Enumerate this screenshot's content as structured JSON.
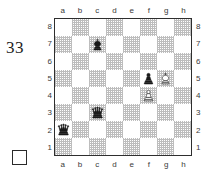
{
  "diagram": {
    "number": "33",
    "side_to_move": "white",
    "side_to_move_icon": "empty-square-icon",
    "files": [
      "a",
      "b",
      "c",
      "d",
      "e",
      "f",
      "g",
      "h"
    ],
    "ranks": [
      "8",
      "7",
      "6",
      "5",
      "4",
      "3",
      "2",
      "1"
    ],
    "board_colors": {
      "light_square": "#ffffff",
      "dark_square": "#bdbdbd",
      "border": "#2e2e2e",
      "text": "#1d1d1d"
    },
    "pieces": [
      {
        "square": "c7",
        "file": "c",
        "rank": "7",
        "color": "black",
        "type": "king",
        "icon": "black-king-icon",
        "symbol": "♚"
      },
      {
        "square": "f5",
        "file": "f",
        "rank": "5",
        "color": "black",
        "type": "pawn",
        "icon": "black-pawn-icon",
        "symbol": "♟"
      },
      {
        "square": "g5",
        "file": "g",
        "rank": "5",
        "color": "white",
        "type": "king",
        "icon": "white-king-icon",
        "symbol": "♔"
      },
      {
        "square": "f4",
        "file": "f",
        "rank": "4",
        "color": "white",
        "type": "pawn",
        "icon": "white-pawn-icon",
        "symbol": "♙"
      },
      {
        "square": "c3",
        "file": "c",
        "rank": "3",
        "color": "black",
        "type": "queen",
        "icon": "black-queen-icon",
        "symbol": "♛"
      },
      {
        "square": "a2",
        "file": "a",
        "rank": "2",
        "color": "black",
        "type": "queen",
        "icon": "black-queen-icon",
        "symbol": "♛"
      }
    ]
  }
}
